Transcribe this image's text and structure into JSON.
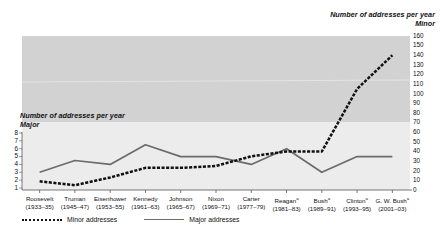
{
  "right_axis": {
    "title_line1": "Number of addresses per year",
    "title_line2": "Minor",
    "ticks": [
      "160",
      "150",
      "140",
      "130",
      "120",
      "110",
      "100",
      "90",
      "80",
      "70",
      "60",
      "50",
      "40",
      "30",
      "20",
      "10",
      "0"
    ]
  },
  "left_axis": {
    "title_line1": "Number of addresses per year",
    "title_line2": "Major",
    "ticks": [
      "8",
      "7",
      "6",
      "5",
      "4",
      "3",
      "2",
      "1"
    ]
  },
  "legend": {
    "minor_label": "Minor addresses",
    "major_label": "Major addresses"
  },
  "x_labels": [
    {
      "name": "Roosevelt",
      "years": "(1933–35)",
      "mark": ""
    },
    {
      "name": "Truman",
      "years": "(1945–47)",
      "mark": ""
    },
    {
      "name": "Eisenhower",
      "years": "(1953–55)",
      "mark": ""
    },
    {
      "name": "Kennedy",
      "years": "(1961–63)",
      "mark": ""
    },
    {
      "name": "Johnson",
      "years": "(1965–67)",
      "mark": ""
    },
    {
      "name": "Nixon",
      "years": "(1969–71)",
      "mark": ""
    },
    {
      "name": "Carter",
      "years": "(1977–79)",
      "mark": ""
    },
    {
      "name": "Reagan",
      "years": "(1981–83)",
      "mark": "a"
    },
    {
      "name": "Bush",
      "years": "(1989–91)",
      "mark": "a"
    },
    {
      "name": "Clinton",
      "years": "(1993–95)",
      "mark": "a"
    },
    {
      "name": "G. W. Bush",
      "years": "(2001–03)",
      "mark": "a"
    }
  ],
  "chart_data": {
    "type": "line",
    "title": "",
    "xlabel": "",
    "ylabel": "Number of addresses per year",
    "grid": false,
    "legend_position": "bottom-left",
    "categories": [
      "Roosevelt (1933–35)",
      "Truman (1945–47)",
      "Eisenhower (1953–55)",
      "Kennedy (1961–63)",
      "Johnson (1965–67)",
      "Nixon (1969–71)",
      "Carter (1977–79)",
      "Reagan (1981–83)",
      "Bush (1989–91)",
      "Clinton (1993–95)",
      "G. W. Bush (2001–03)"
    ],
    "series": [
      {
        "name": "Minor addresses",
        "axis": "right",
        "style": "dotted",
        "color": "#111111",
        "ylim": [
          0,
          160
        ],
        "values": [
          9,
          5,
          13,
          23,
          23,
          25,
          35,
          40,
          40,
          105,
          140
        ]
      },
      {
        "name": "Major addresses",
        "axis": "left",
        "style": "solid",
        "color": "#6b6b6b",
        "ylim": [
          1,
          8
        ],
        "values": [
          3,
          4.5,
          4,
          6.5,
          5,
          5,
          4,
          6,
          3,
          5,
          5
        ]
      }
    ],
    "right_axis_range": [
      0,
      160
    ],
    "right_axis_step": 10,
    "left_axis_range": [
      1,
      8
    ],
    "left_axis_step": 1
  }
}
